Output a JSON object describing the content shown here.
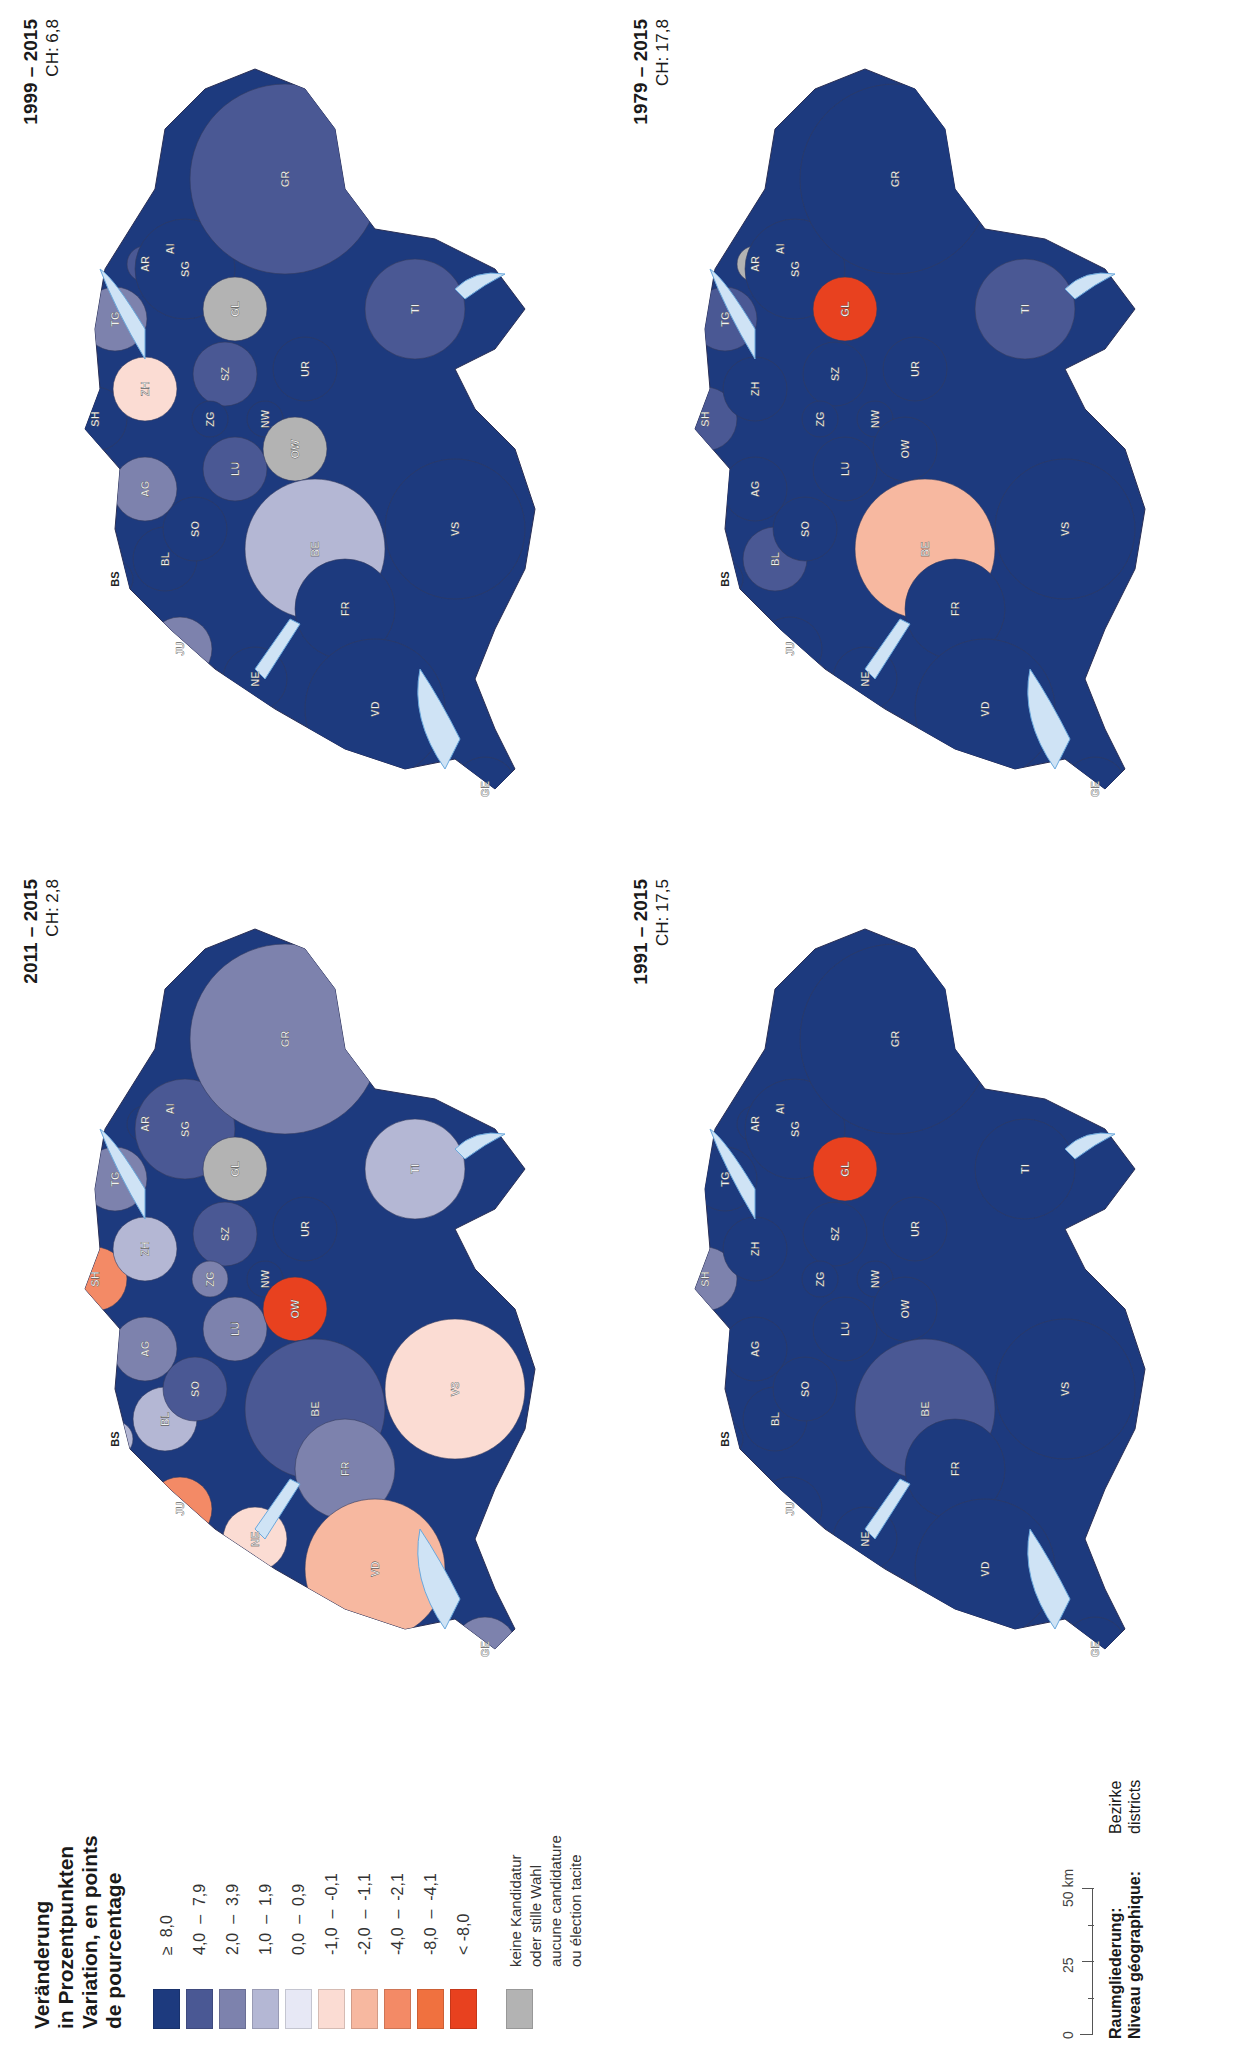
{
  "legend": {
    "title_lines": [
      "Veränderung",
      "in Prozentpunkten",
      "Variation, en points",
      "de pourcentage"
    ],
    "classes": [
      {
        "label": "≥  8,0",
        "color": "#1d3a7e"
      },
      {
        "label": "4,0  –  7,9",
        "color": "#4a5894"
      },
      {
        "label": "2,0  –  3,9",
        "color": "#7d82ad"
      },
      {
        "label": "1,0  –  1,9",
        "color": "#b4b7d4"
      },
      {
        "label": "0,0  –  0,9",
        "color": "#e7e8f5"
      },
      {
        "label": "-1,0  –  -0,1",
        "color": "#fbdcd3"
      },
      {
        "label": "-2,0  –  -1,1",
        "color": "#f7b8a0"
      },
      {
        "label": "-4,0  –  -2,1",
        "color": "#f38a66"
      },
      {
        "label": "-8,0  –  -4,1",
        "color": "#f0713f"
      },
      {
        "label": "< -8,0",
        "color": "#e8411f"
      }
    ],
    "no_data": {
      "lines": [
        "keine Kandidatur",
        "oder stille Wahl",
        "aucune candidature",
        "ou élection tacite"
      ],
      "color": "#b3b3b3"
    }
  },
  "maps": [
    {
      "period": "2011 – 2015",
      "ch": "CH: 2,8"
    },
    {
      "period": "1999 – 2015",
      "ch": "CH: 6,8"
    },
    {
      "period": "1991 – 2015",
      "ch": "CH: 17,5"
    },
    {
      "period": "1979 – 2015",
      "ch": "CH: 17,8"
    }
  ],
  "canton_labels": [
    "BS",
    "BL",
    "SO",
    "AG",
    "SH",
    "ZH",
    "TG",
    "AR",
    "AI",
    "SG",
    "GL",
    "SZ",
    "ZG",
    "LU",
    "NW",
    "OW",
    "UR",
    "BE",
    "JU",
    "NE",
    "FR",
    "VD",
    "GE",
    "VS",
    "TI",
    "GR"
  ],
  "scale": {
    "ticks": [
      "0",
      "25",
      "50 km"
    ]
  },
  "footer": {
    "raum_label": "Raumgliederung:",
    "raum_value": "Bezirke",
    "niveau_label": "Niveau géographique:",
    "niveau_value": "districts"
  },
  "chart_data": [
    {
      "type": "choropleth",
      "title": "2011 – 2015",
      "subtitle": "CH: 2,8",
      "unit": "Veränderung in Prozentpunkten / Variation, en points de pourcentage",
      "level": "Bezirke / districts",
      "cantons": {
        "BS": "1,0 – 1,9",
        "BL": "1,0 – 1,9",
        "SO": "4,0 – 7,9",
        "AG": "2,0 – 3,9",
        "SH": "-4,0 – -2,1",
        "ZH": "1,0 – 1,9",
        "TG": "2,0 – 3,9",
        "AR": "≥ 8,0",
        "AI": "keine Kandidatur",
        "SG": "4,0 – 7,9",
        "GL": "keine Kandidatur",
        "SZ": "4,0 – 7,9",
        "ZG": "2,0 – 3,9",
        "LU": "2,0 – 3,9",
        "NW": "≥ 8,0",
        "OW": "< -8,0",
        "UR": "≥ 8,0",
        "BE": "4,0 – 7,9",
        "JU": "-4,0 – -2,1",
        "NE": "-1,0 – -0,1",
        "FR": "2,0 – 3,9",
        "VD": "-2,0 – -1,1",
        "GE": "2,0 – 3,9",
        "VS": "-1,0 – -0,1",
        "TI": "1,0 – 1,9",
        "GR": "2,0 – 3,9"
      }
    },
    {
      "type": "choropleth",
      "title": "1999 – 2015",
      "subtitle": "CH: 6,8",
      "cantons": {
        "BS": "≥ 8,0",
        "BL": "≥ 8,0",
        "SO": "≥ 8,0",
        "AG": "2,0 – 3,9",
        "SH": "≥ 8,0",
        "ZH": "-1,0 – -0,1",
        "TG": "2,0 – 3,9",
        "AR": "4,0 – 7,9",
        "AI": "< -8,0",
        "SG": "≥ 8,0",
        "GL": "keine Kandidatur",
        "SZ": "4,0 – 7,9",
        "ZG": "≥ 8,0",
        "LU": "4,0 – 7,9",
        "NW": "≥ 8,0",
        "OW": "keine Kandidatur",
        "UR": "≥ 8,0",
        "BE": "1,0 – 1,9",
        "JU": "2,0 – 3,9",
        "NE": "≥ 8,0",
        "FR": "≥ 8,0",
        "VD": "≥ 8,0",
        "GE": "≥ 8,0",
        "VS": "≥ 8,0",
        "TI": "4,0 – 7,9",
        "GR": "4,0 – 7,9"
      }
    },
    {
      "type": "choropleth",
      "title": "1991 – 2015",
      "subtitle": "CH: 17,5",
      "cantons": {
        "BS": "≥ 8,0",
        "BL": "≥ 8,0",
        "SO": "≥ 8,0",
        "AG": "≥ 8,0",
        "SH": "2,0 – 3,9",
        "ZH": "≥ 8,0",
        "TG": "≥ 8,0",
        "AR": "≥ 8,0",
        "AI": "keine Kandidatur",
        "SG": "≥ 8,0",
        "GL": "< -8,0",
        "SZ": "≥ 8,0",
        "ZG": "≥ 8,0",
        "LU": "≥ 8,0",
        "NW": "≥ 8,0",
        "OW": "≥ 8,0",
        "UR": "≥ 8,0",
        "BE": "4,0 – 7,9",
        "JU": "≥ 8,0",
        "NE": "≥ 8,0",
        "FR": "≥ 8,0",
        "VD": "≥ 8,0",
        "GE": "≥ 8,0",
        "VS": "≥ 8,0",
        "TI": "≥ 8,0",
        "GR": "≥ 8,0"
      }
    },
    {
      "type": "choropleth",
      "title": "1979 – 2015",
      "subtitle": "CH: 17,8",
      "cantons": {
        "BS": "≥ 8,0",
        "BL": "4,0 – 7,9",
        "SO": "≥ 8,0",
        "AG": "≥ 8,0",
        "SH": "4,0 – 7,9",
        "ZH": "≥ 8,0",
        "TG": "4,0 – 7,9",
        "AR": "keine Kandidatur",
        "AI": "keine Kandidatur",
        "SG": "≥ 8,0",
        "GL": "< -8,0",
        "SZ": "≥ 8,0",
        "ZG": "≥ 8,0",
        "LU": "≥ 8,0",
        "NW": "≥ 8,0",
        "OW": "≥ 8,0",
        "UR": "≥ 8,0",
        "BE": "-2,0 – -1,1",
        "JU": "≥ 8,0",
        "NE": "≥ 8,0",
        "FR": "≥ 8,0",
        "VD": "≥ 8,0",
        "GE": "≥ 8,0",
        "VS": "≥ 8,0",
        "TI": "4,0 – 7,9",
        "GR": "≥ 8,0"
      }
    }
  ]
}
